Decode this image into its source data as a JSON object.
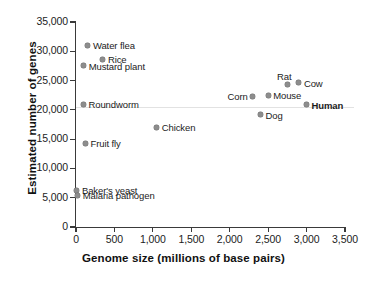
{
  "chart_data": {
    "type": "scatter",
    "title": "",
    "xlabel": "Genome size (millions of base pairs)",
    "ylabel": "Estimated number of genes",
    "xlim": [
      0,
      3500
    ],
    "ylim": [
      0,
      35000
    ],
    "xticks": [
      "0",
      "500",
      "1,000",
      "1,500",
      "2,000",
      "2,500",
      "3,000",
      "3,500"
    ],
    "xtick_values": [
      0,
      500,
      1000,
      1500,
      2000,
      2500,
      3000,
      3500
    ],
    "yticks": [
      "0",
      "5,000",
      "10,000",
      "15,000",
      "20,000",
      "25,000",
      "30,000",
      "35,000"
    ],
    "ytick_values": [
      0,
      5000,
      10000,
      15000,
      20000,
      25000,
      30000,
      35000
    ],
    "grid": false,
    "legend": "none",
    "marker_color": "#8d8d8d",
    "points": [
      {
        "label": "Water flea",
        "x": 155,
        "y": 31000,
        "label_pos": "right"
      },
      {
        "label": "Rice",
        "x": 350,
        "y": 28600,
        "label_pos": "right"
      },
      {
        "label": "Mustard plant",
        "x": 100,
        "y": 27500,
        "label_pos": "right"
      },
      {
        "label": "Roundworm",
        "x": 97,
        "y": 21000,
        "label_pos": "right"
      },
      {
        "label": "Fruit fly",
        "x": 123,
        "y": 14300,
        "label_pos": "right"
      },
      {
        "label": "Baker's yeast",
        "x": 12,
        "y": 6300,
        "label_pos": "right"
      },
      {
        "label": "Malaria pathogen",
        "x": 23,
        "y": 5400,
        "label_pos": "right"
      },
      {
        "label": "Chicken",
        "x": 1050,
        "y": 17000,
        "label_pos": "right"
      },
      {
        "label": "Corn",
        "x": 2300,
        "y": 22300,
        "label_pos": "left"
      },
      {
        "label": "Dog",
        "x": 2400,
        "y": 19200,
        "label_pos": "right"
      },
      {
        "label": "Mouse",
        "x": 2500,
        "y": 22500,
        "label_pos": "right"
      },
      {
        "label": "Rat",
        "x": 2750,
        "y": 24400,
        "label_pos": "above"
      },
      {
        "label": "Cow",
        "x": 2900,
        "y": 24600,
        "label_pos": "right"
      },
      {
        "label": "Human",
        "x": 3000,
        "y": 20900,
        "label_pos": "right",
        "bold": true
      }
    ]
  }
}
